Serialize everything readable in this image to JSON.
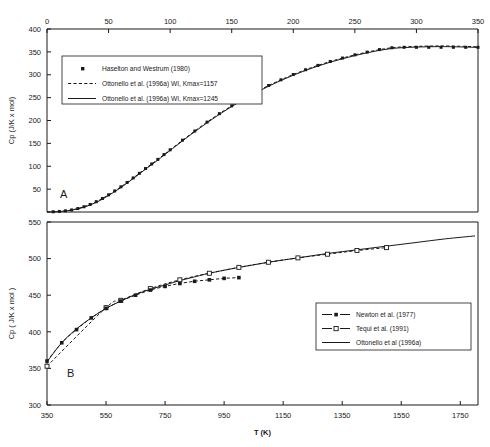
{
  "figure": {
    "panel_a_label": "A",
    "panel_b_label": "B",
    "xaxis_title": "T (K)"
  },
  "chart_data": [
    {
      "type": "line",
      "panel": "A",
      "title": "",
      "xlabel": "",
      "ylabel": "Cp (J/K x mol)",
      "xlim": [
        0,
        350
      ],
      "ylim": [
        0,
        400
      ],
      "xticks": [
        0,
        50,
        100,
        150,
        200,
        250,
        300,
        350
      ],
      "yticks": [
        50,
        100,
        150,
        200,
        250,
        300,
        350,
        400
      ],
      "xtick_labels": [
        "0",
        "50",
        "100",
        "150",
        "200",
        "250",
        "300",
        "350"
      ],
      "ytick_labels": [
        "50",
        "100",
        "150",
        "200",
        "250",
        "300",
        "350",
        "400"
      ],
      "xaxis_position": "top",
      "grid": false,
      "legend_position": "upper left",
      "series": [
        {
          "name": "Haselton and Westrum (1980)",
          "style": "markers",
          "marker": "filled-square",
          "x": [
            5,
            10,
            15,
            20,
            25,
            30,
            35,
            40,
            45,
            50,
            55,
            60,
            65,
            70,
            75,
            80,
            85,
            90,
            95,
            100,
            110,
            120,
            130,
            140,
            150,
            160,
            170,
            180,
            190,
            200,
            210,
            220,
            230,
            240,
            250,
            260,
            270,
            280,
            290,
            300,
            310,
            320,
            330,
            340,
            350
          ],
          "y": [
            0.5,
            1.2,
            2.5,
            4.5,
            7.5,
            11.5,
            16.5,
            22.5,
            29.5,
            37.5,
            46,
            55,
            64.5,
            74.5,
            84.5,
            95,
            105,
            115,
            125.5,
            136,
            157,
            177,
            196.5,
            215,
            232,
            248,
            263,
            276.5,
            289,
            300.5,
            311,
            320.5,
            329,
            336.5,
            343.5,
            349.5,
            355,
            359,
            360,
            360,
            360,
            360,
            360,
            360,
            360
          ]
        },
        {
          "name": "Ottonello et al. (1996a) WI, Kmax=1157",
          "style": "dashed-line",
          "x": [
            0,
            10,
            20,
            30,
            40,
            50,
            60,
            70,
            80,
            90,
            100,
            120,
            140,
            160,
            180,
            200,
            220,
            240,
            260,
            280,
            300,
            320,
            340,
            350
          ],
          "y": [
            0,
            1.2,
            4.5,
            11.5,
            22.5,
            37.5,
            55,
            74.5,
            95,
            115,
            136,
            177,
            215,
            248,
            276.5,
            300.5,
            320.5,
            336.5,
            349.5,
            359,
            362,
            363,
            362,
            361
          ]
        },
        {
          "name": "Ottonello et al. (1996a) WI, Kmax=1245",
          "style": "solid-line",
          "x": [
            0,
            10,
            20,
            30,
            40,
            50,
            60,
            70,
            80,
            90,
            100,
            120,
            140,
            160,
            180,
            200,
            220,
            240,
            260,
            280,
            300,
            320,
            340,
            350
          ],
          "y": [
            0,
            1.0,
            4.0,
            10.5,
            21.0,
            36.0,
            53.5,
            73.0,
            93.5,
            113.5,
            134.5,
            175.5,
            213.5,
            246.5,
            275.0,
            299.0,
            319.0,
            335.0,
            348.0,
            357.5,
            360.5,
            361.5,
            360.5,
            359.5
          ]
        }
      ]
    },
    {
      "type": "line",
      "panel": "B",
      "title": "",
      "xlabel": "T (K)",
      "ylabel": "Cp ( J/K x mol )",
      "xlim": [
        350,
        1810
      ],
      "ylim": [
        300,
        550
      ],
      "xticks": [
        350,
        550,
        750,
        950,
        1150,
        1350,
        1550,
        1750
      ],
      "yticks": [
        300,
        350,
        400,
        450,
        500,
        550
      ],
      "xtick_labels": [
        "350",
        "550",
        "750",
        "950",
        "1150",
        "1350",
        "1550",
        "1750"
      ],
      "ytick_labels": [
        "300",
        "350",
        "400",
        "450",
        "500",
        "550"
      ],
      "xaxis_position": "bottom",
      "grid": false,
      "legend_position": "lower right",
      "series": [
        {
          "name": "Newton et al. (1977)",
          "style": "dashed-line-markers",
          "marker": "filled-square",
          "x": [
            350,
            400,
            450,
            500,
            550,
            600,
            650,
            700,
            750,
            800,
            850,
            900,
            950,
            1000
          ],
          "y": [
            360,
            385,
            403,
            419,
            432,
            442,
            450,
            457,
            462,
            466,
            469,
            471,
            473,
            474
          ]
        },
        {
          "name": "Tequi et al. (1991)",
          "style": "dashed-line-markers",
          "marker": "open-square",
          "x": [
            350,
            550,
            600,
            700,
            800,
            900,
            1000,
            1100,
            1200,
            1300,
            1400,
            1500
          ],
          "y": [
            353,
            433,
            443,
            459,
            471,
            480,
            488,
            495,
            501,
            506,
            511,
            515
          ]
        },
        {
          "name": "Ottonello et al (1996a)",
          "style": "solid-line",
          "x": [
            350,
            400,
            450,
            500,
            550,
            600,
            650,
            700,
            750,
            800,
            850,
            900,
            1000,
            1100,
            1200,
            1300,
            1400,
            1500,
            1600,
            1700,
            1800
          ],
          "y": [
            359,
            385,
            404,
            419,
            432,
            442,
            451,
            458,
            464,
            470,
            475,
            480,
            488,
            495,
            501,
            507,
            512,
            517,
            522,
            527,
            531
          ]
        }
      ]
    }
  ]
}
